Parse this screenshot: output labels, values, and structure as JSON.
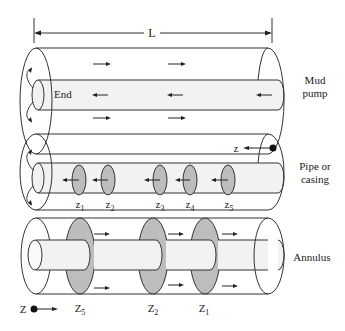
{
  "diagram": {
    "dimension_label": "L",
    "panels": [
      {
        "id": "mud-pump",
        "side_label_line1": "Mud",
        "side_label_line2": "pump",
        "inner_label": "End"
      },
      {
        "id": "pipe-or-casing",
        "side_label_line1": "Pipe or",
        "side_label_line2": "casing",
        "axis_label": "z",
        "positions": [
          "z",
          "z",
          "z",
          "z",
          "z"
        ],
        "subscripts": [
          "1",
          "2",
          "3",
          "4",
          "5"
        ]
      },
      {
        "id": "annulus",
        "side_label_line1": "Annulus",
        "axis_label": "Z",
        "positions": [
          "Z",
          "Z",
          "Z"
        ],
        "subscripts": [
          "5",
          "2",
          "1"
        ]
      }
    ]
  },
  "colors": {
    "line": "#333333",
    "pipe_fill": "#f2f2f2",
    "disk_fill": "#bdbdbd"
  }
}
